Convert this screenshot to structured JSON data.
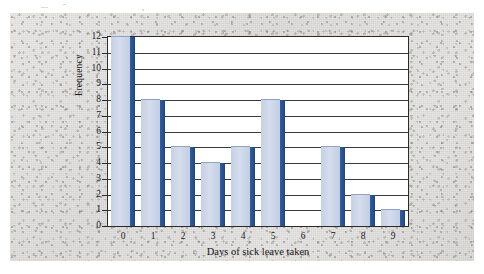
{
  "chart_data": {
    "type": "bar",
    "title": "",
    "xlabel": "Days of sick leave taken",
    "ylabel": "Frequency",
    "categories": [
      "0",
      "1",
      "2",
      "3",
      "4",
      "5",
      "6",
      "7",
      "8",
      "9"
    ],
    "values": [
      12,
      8,
      5,
      4,
      5,
      8,
      0,
      5,
      2,
      1
    ],
    "ylim": [
      0,
      12
    ],
    "yticks": [
      "0",
      "1",
      "2",
      "3",
      "4",
      "5",
      "6",
      "7",
      "8",
      "9",
      "10",
      "11",
      "12"
    ],
    "grid": true,
    "legend": false,
    "legend_position": "none",
    "colors": {
      "bar_face": "#ccd6e8",
      "bar_side": "#2a5699",
      "plot_background": "#ffffff",
      "axis": "#2c2c2c",
      "page_background": "#dedddb"
    }
  }
}
